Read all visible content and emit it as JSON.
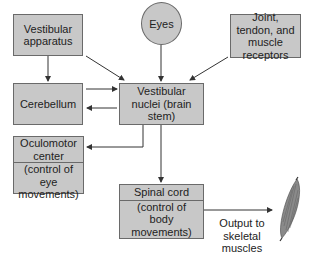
{
  "nodes": {
    "vestibular_apparatus": {
      "label": "Vestibular apparatus"
    },
    "eyes": {
      "label": "Eyes"
    },
    "joint_receptors": {
      "label": "Joint, tendon, and muscle receptors"
    },
    "cerebellum": {
      "label": "Cerebellum"
    },
    "vestibular_nuclei": {
      "label": "Vestibular nuclei (brain stem)"
    },
    "oculomotor_center": {
      "title": "Oculomotor center",
      "subtitle": "(control of eye movements)"
    },
    "spinal_cord": {
      "title": "Spinal cord",
      "subtitle": "(control of body movements)"
    }
  },
  "output_label": "Output to skeletal muscles",
  "icons": {
    "muscle": "skeletal-muscle-illustration"
  },
  "colors": {
    "box_fill": "#c8c8c8",
    "box_border": "#6a6a6a",
    "arrow": "#333333"
  }
}
